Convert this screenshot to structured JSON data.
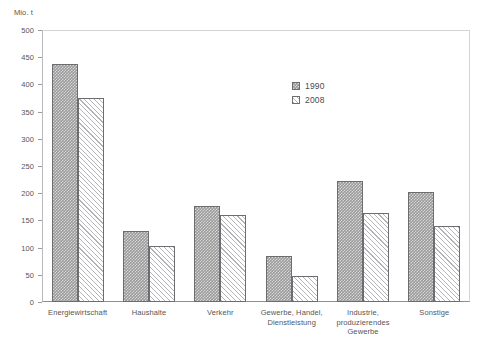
{
  "chart_data": {
    "type": "bar",
    "title": "",
    "subtitle": "",
    "xlabel": "",
    "ylabel": "Mio. t",
    "ylim": [
      0,
      500
    ],
    "ytick_step": 50,
    "yticks": [
      "500",
      "450",
      "400",
      "350",
      "300",
      "250",
      "200",
      "150",
      "100",
      "50",
      "0"
    ],
    "grid": true,
    "legend_position": "inside-top-center",
    "categories": [
      "Energiewirtschaft",
      "Haushalte",
      "Verkehr",
      "Gewerbe, Handel,\nDienstleistung",
      "Industrie,\nproduzierendes\nGewerbe",
      "Sonstige"
    ],
    "category_lines": [
      [
        "Energiewirtschaft"
      ],
      [
        "Haushalte"
      ],
      [
        "Verkehr"
      ],
      [
        "Gewerbe, Handel,",
        "Dienstleistung"
      ],
      [
        "Industrie,",
        "produzierendes",
        "Gewerbe"
      ],
      [
        "Sonstige"
      ]
    ],
    "series": [
      {
        "name": "1990",
        "fill": "gray-dotted",
        "color": "#9a9a9a",
        "values": [
          437,
          130,
          177,
          85,
          222,
          202
        ]
      },
      {
        "name": "2008",
        "fill": "white-hatched",
        "color": "#ffffff",
        "values": [
          375,
          103,
          160,
          48,
          163,
          140
        ]
      }
    ]
  },
  "legend": {
    "items": [
      {
        "label": "1990",
        "style": "gray-dotted"
      },
      {
        "label": "2008",
        "style": "white-hatched"
      }
    ]
  },
  "axis": {
    "y_unit_label": "Mio. t"
  }
}
